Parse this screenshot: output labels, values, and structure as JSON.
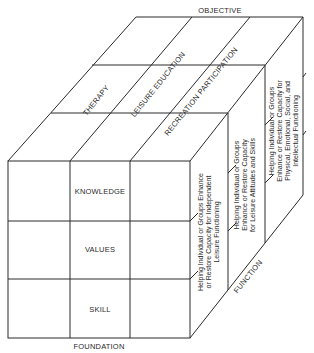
{
  "diagram": {
    "axes": {
      "objective": "OBJECTIVE",
      "foundation": "FOUNDATION",
      "function": "FUNCTION"
    },
    "objectives": [
      "THERAPY",
      "LEISURE EDUCATION",
      "RECREATION PARTICIPATION"
    ],
    "foundations": [
      "KNOWLEDGE",
      "VALUES",
      "SKILL"
    ],
    "functions": [
      {
        "lines": [
          "Helping Individual or Groups Enhance",
          "or Restore Capacity for Independent",
          "Leisure Functioning"
        ]
      },
      {
        "lines": [
          "Helping Individual or Groups",
          "Enhance or Restore Capacity",
          "for Leisure Attitudes and Skills"
        ]
      },
      {
        "lines": [
          "Helping Individual or Groups",
          "Enhance or Restore Capacity for",
          "Physical, Emotional, Social, and",
          "Intellectual Functioning"
        ]
      }
    ],
    "colors": {
      "line": "#2a2a2a",
      "background": "#ffffff"
    }
  }
}
